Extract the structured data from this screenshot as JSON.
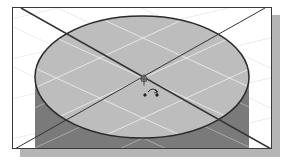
{
  "figure": {
    "colors": {
      "background": "#ffffff",
      "frame_border": "#3a3a3a",
      "shadow": "#b5b5b5",
      "top_face": "#bdbdbd",
      "side_face": "#7a7a7a",
      "grid_lines": "#e8e8e8",
      "edge": "#2a2a2a",
      "axis_lines": "#333333"
    },
    "cylinder": {
      "top_center": [
        129,
        69
      ],
      "rx": 107,
      "ry": 61
    },
    "markers": {
      "origin": "origin-marker",
      "rotate_cursor": "rotate-cursor-icon"
    }
  }
}
